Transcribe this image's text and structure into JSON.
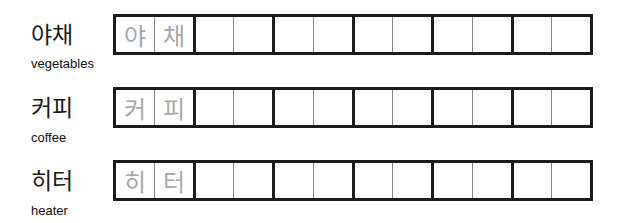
{
  "worksheet": {
    "rows": [
      {
        "korean": "야채",
        "english": "vegetables",
        "trace": [
          "야",
          "채"
        ]
      },
      {
        "korean": "커피",
        "english": "coffee",
        "trace": [
          "커",
          "피"
        ]
      },
      {
        "korean": "히터",
        "english": "heater",
        "trace": [
          "히",
          "터"
        ]
      }
    ],
    "cells_per_row": 12,
    "colors": {
      "grid_border": "#1b1b1b",
      "thin_divider": "#888888",
      "trace_text": "#a8a8a8"
    }
  }
}
